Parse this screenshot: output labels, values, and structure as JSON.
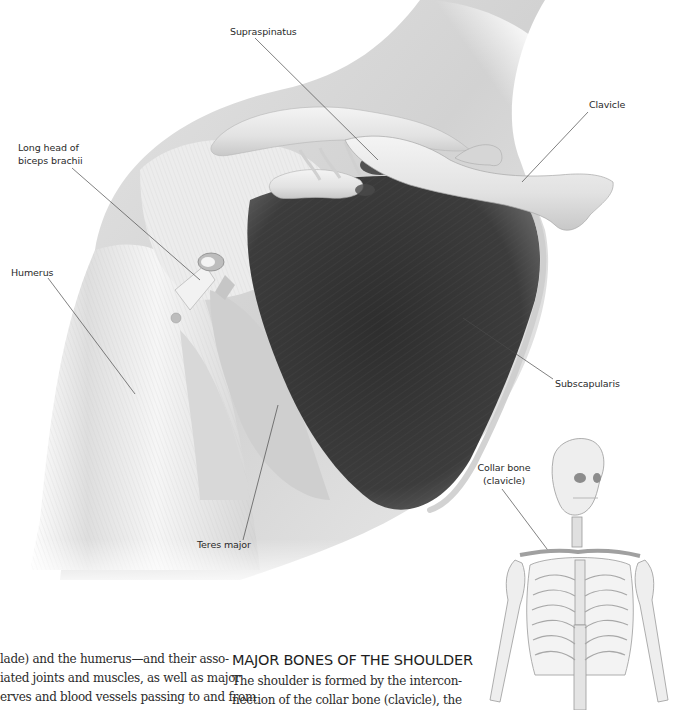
{
  "illustration": {
    "title": "Shoulder anatomy – anterior view",
    "labels": {
      "supraspinatus": "Supraspinatus",
      "clavicle": "Clavicle",
      "long_head_biceps": [
        "Long head of",
        "biceps brachii"
      ],
      "humerus": "Humerus",
      "subscapularis": "Subscapularis",
      "teres_major": "Teres major"
    }
  },
  "inset": {
    "label": [
      "Collar bone",
      "(clavicle)"
    ]
  },
  "text": {
    "left_column": [
      "lade) and the humerus—and their asso-",
      "iated joints and muscles, as well as major",
      "erves and blood vessels passing to and from"
    ],
    "section_heading": "MAJOR BONES OF THE SHOULDER",
    "right_column": [
      "The shoulder is formed by the intercon-",
      "nection of the collar bone (clavicle), the"
    ]
  }
}
